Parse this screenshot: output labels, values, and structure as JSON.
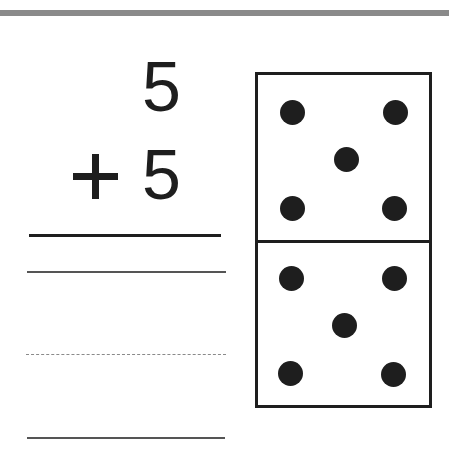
{
  "problem": {
    "addend1": "5",
    "operator": "+",
    "addend2": "5",
    "operator_name": "plus"
  },
  "answer_area": {
    "lines": [
      "solid",
      "dashed",
      "solid"
    ]
  },
  "domino": {
    "top_half": {
      "dots": 5,
      "positions": [
        [
          35,
          38
        ],
        [
          138,
          38
        ],
        [
          89,
          85
        ],
        [
          35,
          134
        ],
        [
          137,
          134
        ]
      ]
    },
    "bottom_half": {
      "dots": 5,
      "positions": [
        [
          34,
          204
        ],
        [
          137,
          204
        ],
        [
          87,
          251
        ],
        [
          33,
          299
        ],
        [
          136,
          300
        ]
      ]
    }
  },
  "colors": {
    "ink": "#1e1e1e",
    "top_bar": "#8a8a8a",
    "guide_line": "#555555"
  }
}
